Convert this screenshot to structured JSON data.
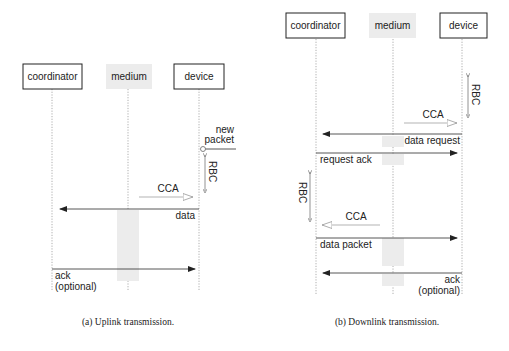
{
  "figure": {
    "panels": [
      {
        "id": "uplink",
        "caption": "(a) Uplink transmission.",
        "actors": [
          "coordinator",
          "medium",
          "device"
        ],
        "messages": [
          {
            "label_1": "new",
            "label_2": "packet",
            "type": "event",
            "at": "device"
          },
          {
            "label": "RBC",
            "type": "backoff",
            "at": "device"
          },
          {
            "label": "CCA",
            "type": "clear-channel-assessment",
            "from": "device",
            "to": "medium"
          },
          {
            "label": "data",
            "type": "frame",
            "from": "device",
            "to": "coordinator"
          },
          {
            "label_1": "ack",
            "label_2": "(optional)",
            "type": "frame",
            "from": "coordinator",
            "to": "device"
          }
        ]
      },
      {
        "id": "downlink",
        "caption": "(b) Downlink transmission.",
        "actors": [
          "coordinator",
          "medium",
          "device"
        ],
        "messages": [
          {
            "label": "RBC",
            "type": "backoff",
            "at": "device"
          },
          {
            "label": "CCA",
            "type": "clear-channel-assessment",
            "from": "device",
            "to": "medium"
          },
          {
            "label": "data request",
            "type": "frame",
            "from": "device",
            "to": "coordinator"
          },
          {
            "label": "request ack",
            "type": "frame",
            "from": "coordinator",
            "to": "device"
          },
          {
            "label": "RBC",
            "type": "backoff",
            "at": "coordinator"
          },
          {
            "label": "CCA",
            "type": "clear-channel-assessment",
            "from": "coordinator",
            "to": "medium"
          },
          {
            "label": "data packet",
            "type": "frame",
            "from": "coordinator",
            "to": "device"
          },
          {
            "label_1": "ack",
            "label_2": "(optional)",
            "type": "frame",
            "from": "device",
            "to": "coordinator"
          }
        ]
      }
    ]
  }
}
